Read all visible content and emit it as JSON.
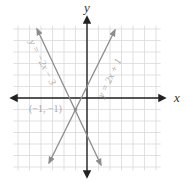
{
  "chart_data": {
    "type": "line",
    "title": "",
    "xlabel": "x",
    "ylabel": "y",
    "xlim": [
      -6,
      6
    ],
    "ylim": [
      -6,
      6
    ],
    "grid": true,
    "grid_step": 1,
    "series": [
      {
        "name": "y = -2x - 3",
        "equation": "y = -2x - 3",
        "slope": -2,
        "intercept": -3,
        "x": [
          -5.5,
          1.2
        ],
        "y": [
          8,
          -5.4
        ],
        "color": "#8c8c8c"
      },
      {
        "name": "y = 2x + 1",
        "equation": "y = 2x + 1",
        "slope": 2,
        "intercept": 1,
        "x": [
          -3.4,
          2.4
        ],
        "y": [
          -5.8,
          5.8
        ],
        "color": "#8c8c8c"
      }
    ],
    "annotations": [
      {
        "text": "(−1, −1)",
        "x": -1,
        "y": -1,
        "type": "intersection-point"
      }
    ]
  },
  "labels": {
    "x_axis": "x",
    "y_axis": "y",
    "line1": "y = −2x − 3",
    "line2": "y = 2x + 1",
    "intersection": "(−1, −1)"
  },
  "colors": {
    "grid": "#d9d9d9",
    "axis": "#222222",
    "line": "#8c8c8c",
    "label": "#a9a9a9"
  }
}
